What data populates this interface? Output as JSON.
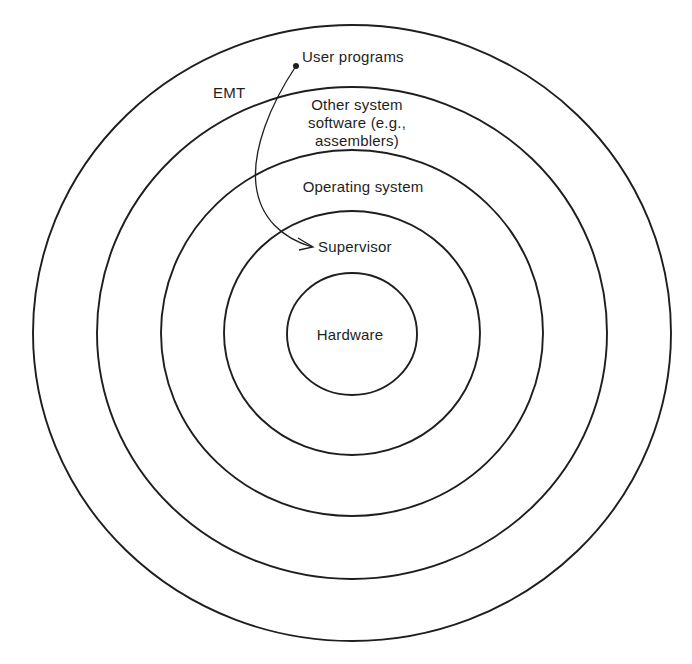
{
  "diagram": {
    "type": "concentric-layers",
    "center": {
      "x": 352,
      "y": 333
    },
    "stroke_color": "#1e1e1e",
    "background_color": "#ffffff",
    "rings": [
      {
        "name": "outer-ring",
        "rx": 319,
        "ry": 308
      },
      {
        "name": "ring-2",
        "rx": 255,
        "ry": 246
      },
      {
        "name": "ring-3",
        "rx": 191,
        "ry": 183
      },
      {
        "name": "ring-4",
        "rx": 128,
        "ry": 122
      },
      {
        "name": "inner-ring",
        "rx": 65,
        "ry": 61
      }
    ],
    "labels": {
      "user_programs": "User programs",
      "emt": "EMT",
      "other_system_software_line1": "Other system",
      "other_system_software_line2": "software (e.g.,",
      "other_system_software_line3": "assemblers)",
      "operating_system": "Operating system",
      "supervisor": "Supervisor",
      "hardware": "Hardware"
    },
    "arrow": {
      "from": "User programs",
      "to": "Supervisor",
      "via": "EMT"
    }
  }
}
